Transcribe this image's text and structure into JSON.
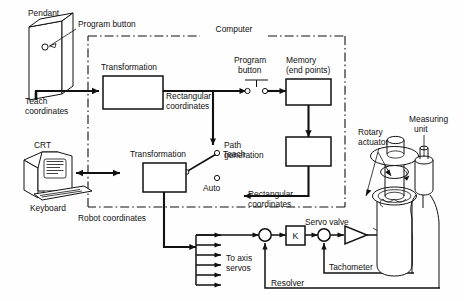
{
  "figure": {
    "background_color": "#fefefe",
    "line_color": "#111111",
    "width": 464,
    "height": 301
  },
  "labels": {
    "pendant": "Pendant",
    "program_button_top": "Program button",
    "computer": "Computer",
    "transformation_1": "Transformation",
    "transformation_2": "Transformation",
    "teach_coordinates_l1": "Teach",
    "teach_coordinates_l2": "coordinates",
    "rectangular_coordinates_1_l1": "Rectangular",
    "rectangular_coordinates_1_l2": "coordinates",
    "program_button_l1": "Program",
    "program_button_l2": "button",
    "memory_l1": "Memory",
    "memory_l2": "(end points)",
    "path_generation_l1": "Path",
    "path_generation_l2": "generation",
    "teach_switch": "Teach",
    "auto_switch": "Auto",
    "rectangular_coordinates_2_l1": "Rectangular",
    "rectangular_coordinates_2_l2": "coordinates",
    "crt": "CRT",
    "keyboard": "Keyboard",
    "robot_coordinates": "Robot coordinates",
    "to_axis_servos_l1": "To axis",
    "to_axis_servos_l2": "servos",
    "gain_block": "K",
    "servo_valve": "Servo valve",
    "tachometer": "Tachometer",
    "resolver": "Resolver",
    "rotary_actuator_l1": "Rotary",
    "rotary_actuator_l2": "actuator",
    "measuring_unit_l1": "Measuring",
    "measuring_unit_l2": "unit"
  },
  "blocks": [
    {
      "name": "transformation-1",
      "label": "Transformation"
    },
    {
      "name": "transformation-2",
      "label": "Transformation"
    },
    {
      "name": "memory-end-points",
      "label": "Memory (end points)"
    },
    {
      "name": "path-generation",
      "label": "Path generation"
    },
    {
      "name": "gain-k",
      "label": "K"
    }
  ],
  "switches": [
    {
      "name": "program-button-switch",
      "label": "Program button",
      "state": "open"
    },
    {
      "name": "teach-auto-switch",
      "positions": [
        "Teach",
        "Auto"
      ],
      "selected": "Teach"
    }
  ],
  "signals": [
    "Teach coordinates",
    "Rectangular coordinates",
    "Robot coordinates",
    "To axis servos",
    "Resolver",
    "Tachometer"
  ],
  "hardware": [
    {
      "name": "pendant",
      "label": "Pendant"
    },
    {
      "name": "crt-terminal",
      "label": "CRT"
    },
    {
      "name": "keyboard",
      "label": "Keyboard"
    },
    {
      "name": "rotary-actuator",
      "label": "Rotary actuator"
    },
    {
      "name": "measuring-unit",
      "label": "Measuring unit"
    },
    {
      "name": "servo-valve",
      "label": "Servo valve"
    }
  ]
}
